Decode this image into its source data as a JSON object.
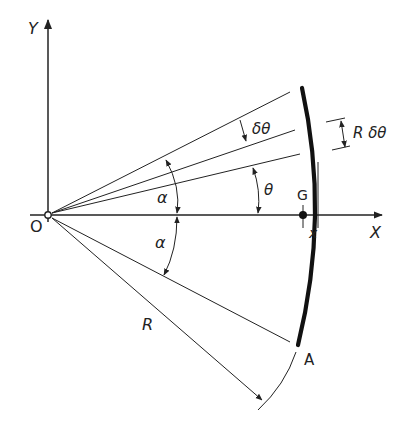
{
  "diagram": {
    "labels": {
      "y_axis": "Y",
      "x_axis": "X",
      "origin": "O",
      "centroid": "G",
      "endpoint": "A",
      "radius": "R",
      "alpha_upper": "α",
      "alpha_lower": "α",
      "theta": "θ",
      "delta_theta": "δθ",
      "arc_element": "R δθ",
      "x_distance": "x"
    },
    "geometry": {
      "origin_px": [
        48,
        215
      ],
      "radius_px": 262,
      "alpha_deg": 27,
      "theta_deg": 13.5,
      "delta_theta_deg": 5.5,
      "radius_dim_angle_deg": -41
    },
    "colors": {
      "ink": "#222222",
      "background": "#ffffff"
    }
  }
}
